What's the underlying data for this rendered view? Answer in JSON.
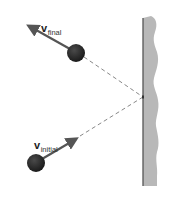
{
  "diagram": {
    "labels": {
      "final": {
        "symbol": "v",
        "subscript": "final"
      },
      "initial": {
        "symbol": "v",
        "subscript": "initial"
      }
    },
    "colors": {
      "ball": "#2a2a2a",
      "arrow": "#555555",
      "path": "#888888",
      "wall_fill": "#b5b5b5",
      "wall_edge": "#555555"
    }
  }
}
